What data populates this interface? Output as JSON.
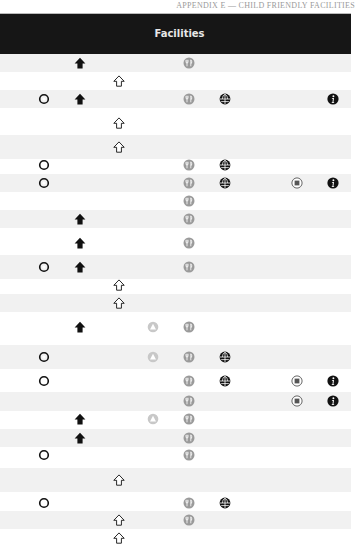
{
  "running_head": "APPENDIX E — CHILD FRIENDLY FACILITIES",
  "header": {
    "title": "Facilities"
  },
  "colors": {
    "header_bg": "#161616",
    "header_text": "#e8e8e8",
    "stripe": "#f1f1f1",
    "restaurant_icon": "#9a9a9a",
    "triangle_icon": "#c8c8c8",
    "dark_icon": "#111111"
  },
  "columns": [
    {
      "key": "ring",
      "icon": "ring-icon",
      "x": 44
    },
    {
      "key": "home",
      "icon": "home-filled-icon",
      "x": 80
    },
    {
      "key": "outline",
      "icon": "house-outline-icon",
      "x": 119
    },
    {
      "key": "triangle",
      "icon": "triangle-circle-icon",
      "x": 153
    },
    {
      "key": "restaurant",
      "icon": "restaurant-icon",
      "x": 189
    },
    {
      "key": "globe",
      "icon": "globe-icon",
      "x": 225
    },
    {
      "key": "square",
      "icon": "square-circle-icon",
      "x": 297
    },
    {
      "key": "info",
      "icon": "info-icon",
      "x": 333
    }
  ],
  "rows": [
    {
      "y": 63,
      "h": 18,
      "stripe": true,
      "icons": [
        "home",
        "restaurant"
      ]
    },
    {
      "y": 81,
      "h": 18,
      "stripe": false,
      "icons": [
        "outline"
      ]
    },
    {
      "y": 99,
      "h": 18,
      "stripe": true,
      "icons": [
        "ring",
        "home",
        "restaurant",
        "globe",
        "info"
      ]
    },
    {
      "y": 123,
      "h": 24,
      "stripe": false,
      "icons": [
        "outline"
      ]
    },
    {
      "y": 147,
      "h": 24,
      "stripe": true,
      "icons": [
        "outline"
      ]
    },
    {
      "y": 165,
      "h": 18,
      "stripe": false,
      "icons": [
        "ring",
        "restaurant",
        "globe"
      ]
    },
    {
      "y": 183,
      "h": 18,
      "stripe": true,
      "icons": [
        "ring",
        "restaurant",
        "globe",
        "square",
        "info"
      ]
    },
    {
      "y": 201,
      "h": 18,
      "stripe": false,
      "icons": [
        "restaurant"
      ]
    },
    {
      "y": 219,
      "h": 18,
      "stripe": true,
      "icons": [
        "home",
        "restaurant"
      ]
    },
    {
      "y": 243,
      "h": 24,
      "stripe": false,
      "icons": [
        "home",
        "restaurant"
      ]
    },
    {
      "y": 267,
      "h": 24,
      "stripe": true,
      "icons": [
        "ring",
        "home",
        "restaurant"
      ]
    },
    {
      "y": 285,
      "h": 18,
      "stripe": false,
      "icons": [
        "outline"
      ]
    },
    {
      "y": 303,
      "h": 18,
      "stripe": true,
      "icons": [
        "outline"
      ]
    },
    {
      "y": 327,
      "h": 24,
      "stripe": false,
      "icons": [
        "home",
        "triangle",
        "restaurant"
      ]
    },
    {
      "y": 357,
      "h": 24,
      "stripe": true,
      "icons": [
        "ring",
        "triangle",
        "restaurant",
        "globe"
      ]
    },
    {
      "y": 381,
      "h": 22,
      "stripe": false,
      "icons": [
        "ring",
        "restaurant",
        "globe",
        "square",
        "info"
      ]
    },
    {
      "y": 401,
      "h": 19,
      "stripe": true,
      "icons": [
        "restaurant",
        "square",
        "info"
      ]
    },
    {
      "y": 419,
      "h": 18,
      "stripe": false,
      "icons": [
        "home",
        "triangle",
        "restaurant"
      ]
    },
    {
      "y": 438,
      "h": 18,
      "stripe": true,
      "icons": [
        "home",
        "restaurant"
      ]
    },
    {
      "y": 455,
      "h": 18,
      "stripe": false,
      "icons": [
        "ring",
        "restaurant"
      ]
    },
    {
      "y": 480,
      "h": 24,
      "stripe": true,
      "icons": [
        "outline"
      ]
    },
    {
      "y": 503,
      "h": 22,
      "stripe": false,
      "icons": [
        "ring",
        "restaurant",
        "globe"
      ]
    },
    {
      "y": 520,
      "h": 18,
      "stripe": true,
      "icons": [
        "outline",
        "restaurant"
      ]
    },
    {
      "y": 538,
      "h": 18,
      "stripe": false,
      "icons": [
        "outline"
      ]
    }
  ]
}
